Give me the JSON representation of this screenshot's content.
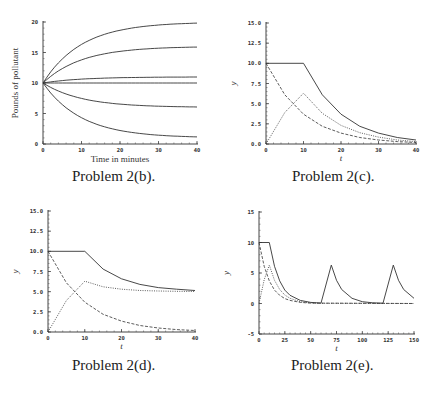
{
  "chart_data": [
    {
      "id": "b",
      "type": "line",
      "caption": "Problem 2(b).",
      "xlabel": "Time in minutes",
      "ylabel": "Pounds of pollutant",
      "xlim": [
        0,
        40
      ],
      "ylim": [
        0,
        20
      ],
      "xticks": [
        0,
        10,
        20,
        30,
        40
      ],
      "yticks": [
        0,
        5,
        10,
        15,
        20
      ],
      "grid": false,
      "series": [
        {
          "name": "L=20",
          "style": "solid",
          "formula": "20 - 10*exp(-t/10)",
          "limit": 20
        },
        {
          "name": "L=16",
          "style": "solid",
          "formula": "16 - 6*exp(-t/10)",
          "limit": 16
        },
        {
          "name": "L=11",
          "style": "solid",
          "formula": "11 - 1*exp(-t/10)",
          "limit": 11
        },
        {
          "name": "L=10",
          "style": "solid",
          "formula": "10",
          "limit": 10
        },
        {
          "name": "L=6",
          "style": "solid",
          "formula": "6 + 4*exp(-t/10)",
          "limit": 6
        },
        {
          "name": "L=1",
          "style": "solid",
          "formula": "1 + 9*exp(-t/10)",
          "limit": 1
        }
      ]
    },
    {
      "id": "c",
      "type": "line",
      "caption": "Problem 2(c).",
      "xlabel": "t",
      "ylabel": "y",
      "xlim": [
        0,
        40
      ],
      "ylim": [
        0,
        15
      ],
      "xticks": [
        0,
        10,
        20,
        30,
        40
      ],
      "yticks": [
        "0.0",
        "2.5",
        "5.0",
        "7.5",
        "10.0",
        "12.5",
        "15.0"
      ],
      "grid": false,
      "series": [
        {
          "name": "total",
          "style": "solid",
          "points": [
            [
              0,
              10
            ],
            [
              10,
              10
            ],
            [
              15,
              6.1
            ],
            [
              20,
              3.7
            ],
            [
              25,
              2.2
            ],
            [
              30,
              1.35
            ],
            [
              35,
              0.8
            ],
            [
              40,
              0.5
            ]
          ]
        },
        {
          "name": "second",
          "style": "dotted",
          "points": [
            [
              0,
              0
            ],
            [
              5,
              3.9
            ],
            [
              10,
              6.3
            ],
            [
              15,
              3.8
            ],
            [
              20,
              2.3
            ],
            [
              25,
              1.4
            ],
            [
              30,
              0.85
            ],
            [
              35,
              0.5
            ],
            [
              40,
              0.3
            ]
          ]
        },
        {
          "name": "first",
          "style": "dashed",
          "points": [
            [
              0,
              10
            ],
            [
              5,
              6.1
            ],
            [
              10,
              3.7
            ],
            [
              15,
              2.2
            ],
            [
              20,
              1.35
            ],
            [
              25,
              0.8
            ],
            [
              30,
              0.5
            ],
            [
              35,
              0.3
            ],
            [
              40,
              0.18
            ]
          ]
        }
      ]
    },
    {
      "id": "d",
      "type": "line",
      "caption": "Problem 2(d).",
      "xlabel": "t",
      "ylabel": "y",
      "xlim": [
        0,
        40
      ],
      "ylim": [
        0,
        15
      ],
      "xticks": [
        0,
        10,
        20,
        30,
        40
      ],
      "yticks": [
        "0.0",
        "2.5",
        "5.0",
        "7.5",
        "10.0",
        "12.5",
        "15.0"
      ],
      "grid": false,
      "series": [
        {
          "name": "total",
          "style": "solid",
          "points": [
            [
              0,
              10
            ],
            [
              10,
              10
            ],
            [
              15,
              7.8
            ],
            [
              20,
              6.6
            ],
            [
              25,
              5.9
            ],
            [
              30,
              5.5
            ],
            [
              35,
              5.3
            ],
            [
              40,
              5.15
            ]
          ]
        },
        {
          "name": "second",
          "style": "dotted",
          "points": [
            [
              0,
              0
            ],
            [
              5,
              3.9
            ],
            [
              10,
              6.3
            ],
            [
              15,
              5.6
            ],
            [
              20,
              5.3
            ],
            [
              25,
              5.15
            ],
            [
              30,
              5.08
            ],
            [
              35,
              5.04
            ],
            [
              40,
              5.02
            ]
          ]
        },
        {
          "name": "first",
          "style": "dashed",
          "points": [
            [
              0,
              10
            ],
            [
              5,
              6.1
            ],
            [
              10,
              3.7
            ],
            [
              15,
              2.2
            ],
            [
              20,
              1.35
            ],
            [
              25,
              0.8
            ],
            [
              30,
              0.5
            ],
            [
              35,
              0.3
            ],
            [
              40,
              0.18
            ]
          ]
        }
      ]
    },
    {
      "id": "e",
      "type": "line",
      "caption": "Problem 2(e).",
      "xlabel": "t",
      "ylabel": "y",
      "xlim": [
        0,
        150
      ],
      "ylim": [
        -5,
        15
      ],
      "xticks": [
        0,
        25,
        50,
        75,
        100,
        125,
        150
      ],
      "yticks": [
        -5,
        0,
        5,
        10,
        15
      ],
      "grid": false,
      "series": [
        {
          "name": "total",
          "style": "solid",
          "points": [
            [
              0,
              10
            ],
            [
              10,
              10
            ],
            [
              15,
              6.1
            ],
            [
              20,
              3.7
            ],
            [
              25,
              2.2
            ],
            [
              30,
              1.35
            ],
            [
              40,
              0.5
            ],
            [
              50,
              0.18
            ],
            [
              60,
              0.07
            ],
            [
              70,
              6.3
            ],
            [
              75,
              3.8
            ],
            [
              80,
              2.3
            ],
            [
              90,
              0.85
            ],
            [
              100,
              0.3
            ],
            [
              110,
              0.12
            ],
            [
              120,
              0.05
            ],
            [
              130,
              6.3
            ],
            [
              135,
              3.8
            ],
            [
              140,
              2.3
            ],
            [
              150,
              0.85
            ]
          ]
        },
        {
          "name": "second",
          "style": "dotted",
          "points": [
            [
              0,
              0
            ],
            [
              5,
              3.9
            ],
            [
              10,
              6.3
            ],
            [
              15,
              3.8
            ],
            [
              20,
              2.3
            ],
            [
              25,
              1.4
            ],
            [
              30,
              0.85
            ],
            [
              40,
              0.3
            ],
            [
              50,
              0.1
            ],
            [
              60,
              0.04
            ],
            [
              150,
              0
            ]
          ]
        },
        {
          "name": "first",
          "style": "dashed",
          "points": [
            [
              0,
              10
            ],
            [
              5,
              6.1
            ],
            [
              10,
              3.7
            ],
            [
              15,
              2.2
            ],
            [
              20,
              1.35
            ],
            [
              25,
              0.8
            ],
            [
              30,
              0.5
            ],
            [
              40,
              0.18
            ],
            [
              50,
              0.07
            ],
            [
              150,
              0
            ]
          ]
        }
      ]
    }
  ]
}
